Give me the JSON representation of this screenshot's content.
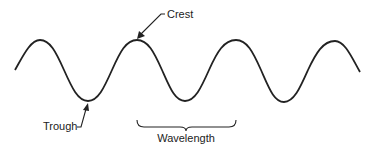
{
  "diagram": {
    "type": "wave-anatomy",
    "labels": {
      "crest": "Crest",
      "trough": "Trough",
      "wavelength": "Wavelength"
    },
    "colors": {
      "stroke": "#222222",
      "background": "#ffffff"
    }
  }
}
